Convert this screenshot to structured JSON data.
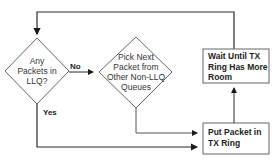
{
  "diagram": {
    "type": "flowchart",
    "nodes": {
      "llq_check": {
        "shape": "diamond",
        "label_lines": [
          "Any",
          "Packets in",
          "LLQ?"
        ]
      },
      "pick_next": {
        "shape": "diamond",
        "label_lines": [
          "Pick Next",
          "Packet from",
          "Other Non-LLQ",
          "Queues"
        ]
      },
      "wait_tx": {
        "shape": "rectangle",
        "label_lines": [
          "Wait Until TX",
          "Ring Has More",
          "Room"
        ]
      },
      "put_packet": {
        "shape": "rectangle",
        "label_lines": [
          "Put Packet in",
          "TX Ring"
        ]
      }
    },
    "edges": [
      {
        "from": "llq_check",
        "to": "pick_next",
        "label": "No"
      },
      {
        "from": "llq_check",
        "to": "put_packet",
        "label": "Yes"
      },
      {
        "from": "pick_next",
        "to": "put_packet",
        "label": ""
      },
      {
        "from": "put_packet",
        "to": "wait_tx",
        "label": ""
      },
      {
        "from": "wait_tx",
        "to": "llq_check",
        "label": ""
      }
    ],
    "edge_labels": {
      "no": "No",
      "yes": "Yes"
    },
    "colors": {
      "line": "#2a2a2a",
      "shape_border": "#555555",
      "text": "#222222"
    }
  }
}
